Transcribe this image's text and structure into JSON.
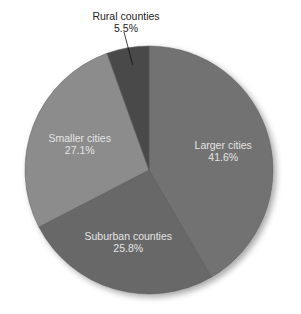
{
  "chart_data": {
    "type": "pie",
    "title": "",
    "start_angle": "12 o'clock",
    "direction": "clockwise",
    "categories": [
      "Larger cities",
      "Suburban counties",
      "Smaller cities",
      "Rural counties"
    ],
    "values": [
      41.6,
      25.8,
      27.1,
      5.5
    ],
    "unit": "%",
    "labels": [
      {
        "name": "Larger cities",
        "value_label": "41.6%",
        "position": "inside"
      },
      {
        "name": "Suburban counties",
        "value_label": "25.8%",
        "position": "inside"
      },
      {
        "name": "Smaller cities",
        "value_label": "27.1%",
        "position": "inside"
      },
      {
        "name": "Rural counties",
        "value_label": "5.5%",
        "position": "outside",
        "leader_line": true
      }
    ],
    "colors": [
      "#727272",
      "#676767",
      "#8c8c8c",
      "#4a4a4a"
    ],
    "legend": "none"
  }
}
